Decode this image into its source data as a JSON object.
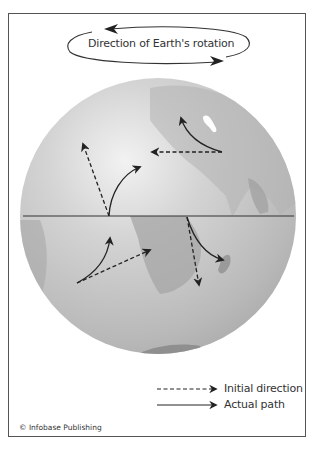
{
  "diagram": {
    "title": "Direction of Earth's rotation",
    "colors": {
      "frame": "#555555",
      "ink": "#222222",
      "ocean": "#c9c9c9",
      "land": "#a8a8a8",
      "highlight": "#f4f4f4",
      "equator": "#333333"
    },
    "globe": {
      "cx": 158,
      "cy": 216,
      "r": 138,
      "equator_y": 216
    },
    "deflection_arrows": [
      {
        "hemisphere": "northern",
        "origin": [
          109,
          216
        ],
        "initial_direction_tip": [
          82,
          142
        ],
        "actual_path_tip": [
          141,
          166
        ]
      },
      {
        "hemisphere": "northern",
        "origin": [
          222,
          152
        ],
        "initial_direction_tip": [
          150,
          152
        ],
        "actual_path_tip": [
          180,
          116
        ]
      },
      {
        "hemisphere": "southern",
        "origin": [
          77,
          283
        ],
        "initial_direction_tip": [
          152,
          249
        ],
        "actual_path_tip": [
          110,
          236
        ]
      },
      {
        "hemisphere": "southern",
        "origin": [
          187,
          217
        ],
        "initial_direction_tip": [
          199,
          287
        ],
        "actual_path_tip": [
          225,
          260
        ]
      }
    ],
    "legend": {
      "items": [
        {
          "style": "dashed",
          "label": "Initial direction"
        },
        {
          "style": "solid",
          "label": "Actual path"
        }
      ]
    },
    "credit": "© Infobase Publishing"
  }
}
